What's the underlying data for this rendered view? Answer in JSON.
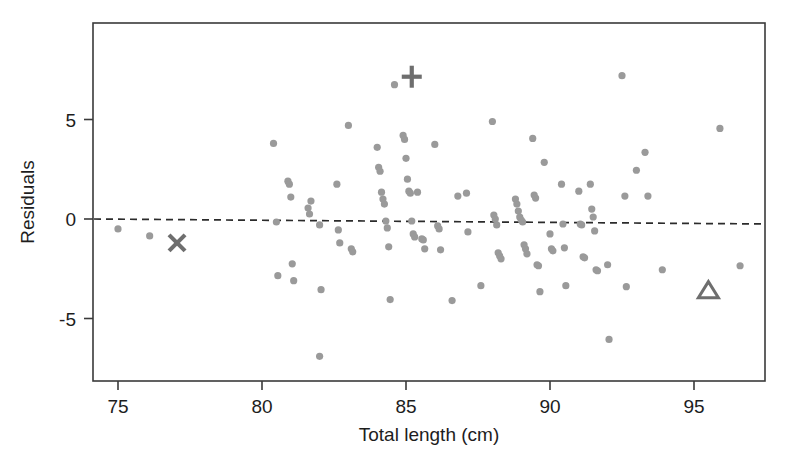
{
  "chart_data": {
    "type": "scatter",
    "title": "",
    "xlabel": "Total length (cm)",
    "ylabel": "Residuals",
    "xlim": [
      73.4,
      97.5
    ],
    "ylim": [
      -8.0,
      9.0
    ],
    "xticks": [
      75,
      80,
      85,
      90,
      95
    ],
    "xtick_labels": [
      "75",
      "80",
      "85",
      "90",
      "95"
    ],
    "yticks": [
      5,
      0,
      -5
    ],
    "ytick_labels": [
      "5",
      "0",
      "-5"
    ],
    "grid": false,
    "legend": null,
    "point_color": "#9a9a9a",
    "marker_color": "#6e6e6e",
    "axis_color": "#3a3a3a",
    "reference_line": {
      "style": "dashed",
      "label": "zero residual line",
      "x_start": 73.4,
      "y_start": 0.0,
      "x_end": 97.5,
      "y_end": -0.25
    },
    "series": [
      {
        "name": "residuals",
        "marker": "circle",
        "color": "#9a9a9a",
        "points": [
          [
            75.0,
            -0.5
          ],
          [
            76.1,
            -0.85
          ],
          [
            80.4,
            3.8
          ],
          [
            80.5,
            -0.15
          ],
          [
            80.55,
            -2.85
          ],
          [
            80.9,
            1.9
          ],
          [
            80.95,
            1.75
          ],
          [
            81.0,
            1.1
          ],
          [
            81.05,
            -2.25
          ],
          [
            81.1,
            -3.1
          ],
          [
            81.6,
            0.55
          ],
          [
            81.65,
            0.25
          ],
          [
            81.7,
            0.9
          ],
          [
            82.0,
            -0.3
          ],
          [
            82.05,
            -3.55
          ],
          [
            82.0,
            -6.9
          ],
          [
            82.6,
            1.75
          ],
          [
            82.65,
            -0.55
          ],
          [
            82.7,
            -1.2
          ],
          [
            83.0,
            4.7
          ],
          [
            83.1,
            -1.5
          ],
          [
            83.15,
            -1.65
          ],
          [
            84.0,
            3.6
          ],
          [
            84.05,
            2.6
          ],
          [
            84.1,
            2.4
          ],
          [
            84.15,
            1.35
          ],
          [
            84.2,
            1.0
          ],
          [
            84.25,
            0.75
          ],
          [
            84.3,
            -0.1
          ],
          [
            84.35,
            -0.45
          ],
          [
            84.4,
            -1.4
          ],
          [
            84.45,
            -4.05
          ],
          [
            84.6,
            6.75
          ],
          [
            84.9,
            4.2
          ],
          [
            84.95,
            4.0
          ],
          [
            85.0,
            3.05
          ],
          [
            85.05,
            2.0
          ],
          [
            85.1,
            1.4
          ],
          [
            85.15,
            1.3
          ],
          [
            85.2,
            -0.1
          ],
          [
            85.25,
            -0.75
          ],
          [
            85.3,
            -0.9
          ],
          [
            85.4,
            1.35
          ],
          [
            85.55,
            -1.0
          ],
          [
            85.6,
            -1.05
          ],
          [
            85.65,
            -1.5
          ],
          [
            86.0,
            3.75
          ],
          [
            86.1,
            -0.35
          ],
          [
            86.15,
            -0.5
          ],
          [
            86.2,
            -1.55
          ],
          [
            86.6,
            -4.1
          ],
          [
            86.8,
            1.15
          ],
          [
            87.1,
            1.3
          ],
          [
            87.15,
            -0.65
          ],
          [
            87.6,
            -3.35
          ],
          [
            88.0,
            4.9
          ],
          [
            88.05,
            0.2
          ],
          [
            88.1,
            0.0
          ],
          [
            88.15,
            -0.3
          ],
          [
            88.2,
            -1.7
          ],
          [
            88.25,
            -1.85
          ],
          [
            88.3,
            -2.0
          ],
          [
            88.8,
            1.0
          ],
          [
            88.85,
            0.75
          ],
          [
            88.9,
            0.4
          ],
          [
            88.95,
            0.1
          ],
          [
            89.0,
            -0.05
          ],
          [
            89.05,
            -0.15
          ],
          [
            89.1,
            -1.3
          ],
          [
            89.15,
            -1.5
          ],
          [
            89.2,
            -1.75
          ],
          [
            89.4,
            4.05
          ],
          [
            89.45,
            1.2
          ],
          [
            89.5,
            1.05
          ],
          [
            89.55,
            -2.3
          ],
          [
            89.6,
            -2.35
          ],
          [
            89.65,
            -3.65
          ],
          [
            89.8,
            2.85
          ],
          [
            90.0,
            -0.75
          ],
          [
            90.05,
            -1.5
          ],
          [
            90.1,
            -1.6
          ],
          [
            90.4,
            1.75
          ],
          [
            90.45,
            -0.25
          ],
          [
            90.5,
            -1.45
          ],
          [
            90.55,
            -3.35
          ],
          [
            91.0,
            1.4
          ],
          [
            91.05,
            -0.25
          ],
          [
            91.1,
            -0.3
          ],
          [
            91.15,
            -1.9
          ],
          [
            91.2,
            -1.95
          ],
          [
            91.4,
            1.75
          ],
          [
            91.45,
            0.5
          ],
          [
            91.5,
            0.1
          ],
          [
            91.55,
            -0.6
          ],
          [
            91.6,
            -2.55
          ],
          [
            91.65,
            -2.6
          ],
          [
            92.0,
            -2.3
          ],
          [
            92.05,
            -6.05
          ],
          [
            92.5,
            7.2
          ],
          [
            92.6,
            1.15
          ],
          [
            92.65,
            -3.4
          ],
          [
            93.0,
            2.45
          ],
          [
            93.3,
            3.35
          ],
          [
            93.4,
            1.15
          ],
          [
            93.9,
            -2.55
          ],
          [
            95.9,
            4.55
          ],
          [
            96.6,
            -2.35
          ]
        ]
      },
      {
        "name": "highlighted-plus",
        "marker": "plus",
        "color": "#6e6e6e",
        "points": [
          [
            85.2,
            7.15
          ]
        ]
      },
      {
        "name": "highlighted-cross",
        "marker": "x",
        "color": "#6e6e6e",
        "points": [
          [
            77.05,
            -1.2
          ]
        ]
      },
      {
        "name": "highlighted-triangle",
        "marker": "triangle-open",
        "color": "#6e6e6e",
        "points": [
          [
            95.5,
            -3.6
          ]
        ]
      }
    ]
  },
  "figure": {
    "ylabel_text": "Residuals",
    "xlabel_text": "Total length (cm)"
  }
}
